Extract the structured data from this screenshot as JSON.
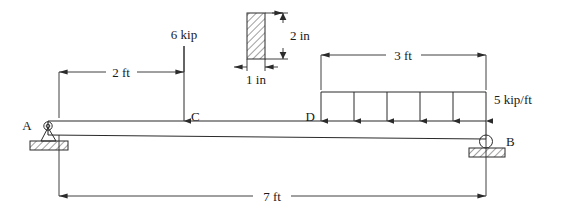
{
  "figure": {
    "kind": "statics-beam-free-body-diagram",
    "background_color": "#ffffff",
    "line_color": "#2b2b2b",
    "text_color": "#1a1a1a"
  },
  "nodes": [
    {
      "id": "A",
      "label": "A",
      "support": "pin",
      "x_ft": 0
    },
    {
      "id": "B",
      "label": "B",
      "support": "roller",
      "x_ft": 7
    },
    {
      "id": "C",
      "label": "C",
      "support": "none",
      "x_ft": 2
    },
    {
      "id": "D",
      "label": "D",
      "support": "none",
      "x_ft": 4
    }
  ],
  "loads": {
    "point_load": {
      "label": "6 kip",
      "magnitude": 6,
      "unit": "kip",
      "applied_at": "C",
      "direction": "down"
    },
    "distributed_load": {
      "label": "5 kip/ft",
      "magnitude": 5,
      "unit": "kip/ft",
      "from": "D",
      "to": "B",
      "direction": "down",
      "arrow_count": 6
    }
  },
  "dimensions": [
    {
      "name": "a-to-c",
      "label": "2 ft",
      "value": 2,
      "unit": "ft"
    },
    {
      "name": "d-to-b",
      "label": "3 ft",
      "value": 3,
      "unit": "ft"
    },
    {
      "name": "a-to-b",
      "label": "7 ft",
      "value": 7,
      "unit": "ft"
    }
  ],
  "cross_section": {
    "title": "beam cross section",
    "width_label": "1 in",
    "width_value": 1,
    "height_label": "2 in",
    "height_value": 2,
    "unit": "in",
    "hatched": true
  }
}
